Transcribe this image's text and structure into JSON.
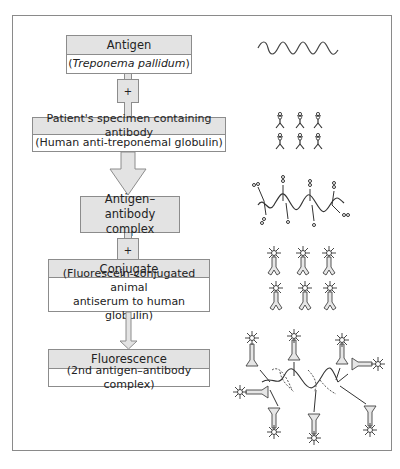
{
  "flowchart": {
    "steps": [
      {
        "title": "Antigen",
        "subtitle_prefix": "(",
        "subtitle_italic": "Treponema pallidum",
        "subtitle_suffix": ")"
      },
      {
        "title": "Patient's specimen containing antibody",
        "subtitle": "(Human anti-treponemal globulin)"
      },
      {
        "title_line1": "Antigen–antibody",
        "title_line2": "complex"
      },
      {
        "title": "Conjugate",
        "subtitle_line1": "(Fluorescein-conjugated animal",
        "subtitle_line2": "antiserum to human globulin)"
      },
      {
        "title": "Fluorescence",
        "subtitle": "(2nd antigen–antibody complex)"
      }
    ],
    "connectors": [
      {
        "type": "plus",
        "label": "+"
      },
      {
        "type": "arrow"
      },
      {
        "type": "plus",
        "label": "+"
      },
      {
        "type": "arrow"
      }
    ]
  },
  "illustrations": [
    {
      "name": "treponema-spirochete"
    },
    {
      "name": "antibodies-grid",
      "count": 6
    },
    {
      "name": "antigen-antibody-complex"
    },
    {
      "name": "fluorescein-conjugate-grid",
      "count": 6
    },
    {
      "name": "fluorescent-complex"
    }
  ],
  "colors": {
    "box_fill": "#e3e3e3",
    "border": "#8c8c8c",
    "ink": "#333333"
  }
}
